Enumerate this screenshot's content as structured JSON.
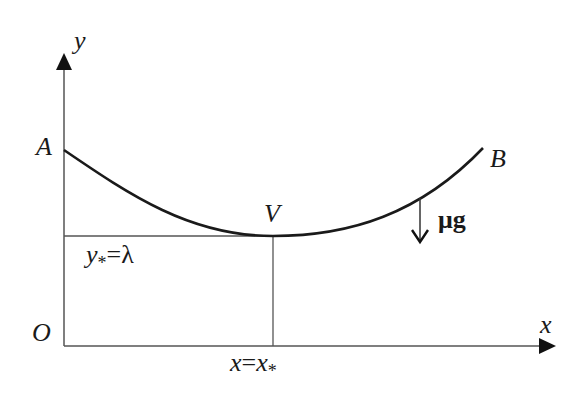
{
  "diagram": {
    "type": "catenary-curve",
    "axes": {
      "x_label": "x",
      "y_label": "y",
      "origin_label": "O"
    },
    "points": {
      "A": "A",
      "B": "B",
      "V": "V"
    },
    "annotations": {
      "y_star_label": "y",
      "y_star_sub": "*",
      "y_star_eq": "=",
      "y_star_value": "λ",
      "x_star_lhs": "x",
      "x_star_eq": "=",
      "x_star_rhs": "x",
      "x_star_sub": "*",
      "force_label": "μg"
    },
    "colors": {
      "curve": "#1a1a1a",
      "axes": "#555555",
      "guides": "#555555"
    }
  }
}
